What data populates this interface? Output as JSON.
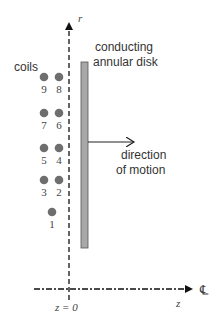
{
  "labels": {
    "coils": "coils",
    "disk_line1": "conducting",
    "disk_line2": "annular disk",
    "motion_line1": "direction",
    "motion_line2": "of motion",
    "r_axis": "r",
    "z_axis": "z",
    "z_origin": "z = 0",
    "centerline": "℄"
  },
  "coils": [
    {
      "id": "9",
      "label": "9",
      "x": 44,
      "y": 77
    },
    {
      "id": "8",
      "label": "8",
      "x": 59,
      "y": 77
    },
    {
      "id": "7",
      "label": "7",
      "x": 44,
      "y": 113
    },
    {
      "id": "6",
      "label": "6",
      "x": 59,
      "y": 113
    },
    {
      "id": "5",
      "label": "5",
      "x": 44,
      "y": 148
    },
    {
      "id": "4",
      "label": "4",
      "x": 59,
      "y": 148
    },
    {
      "id": "3",
      "label": "3",
      "x": 44,
      "y": 180
    },
    {
      "id": "2",
      "label": "2",
      "x": 59,
      "y": 180
    },
    {
      "id": "1",
      "label": "1",
      "x": 52,
      "y": 212
    }
  ],
  "colors": {
    "coil_fill": "#6e6e6e",
    "disk_fill": "#a8a8a8",
    "disk_stroke": "#555555",
    "axis_stroke": "#111111",
    "text": "#333333"
  }
}
